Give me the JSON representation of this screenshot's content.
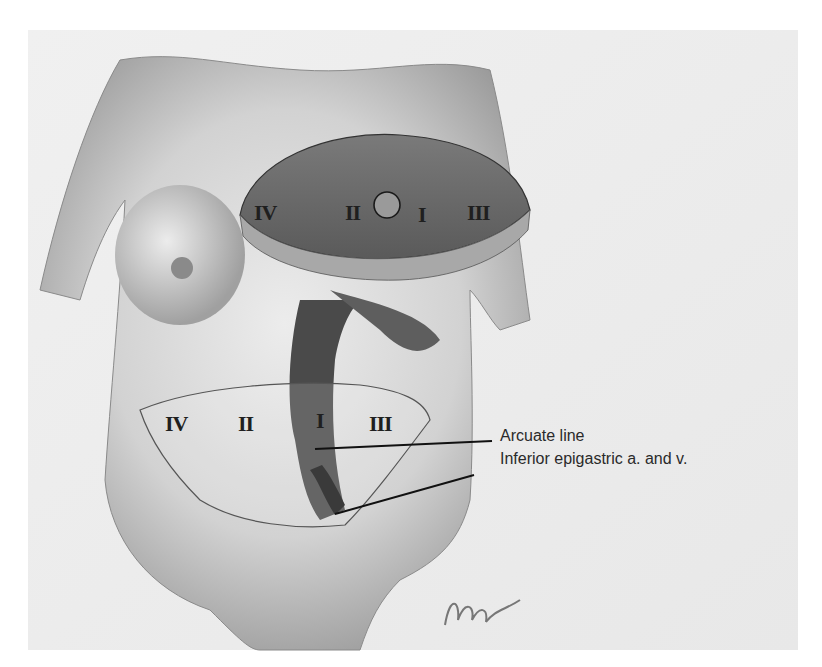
{
  "figure": {
    "upper_flap": {
      "zones": [
        {
          "label": "IV",
          "x": 254,
          "y": 202
        },
        {
          "label": "II",
          "x": 345,
          "y": 202
        },
        {
          "label": "I",
          "x": 418,
          "y": 204
        },
        {
          "label": "III",
          "x": 467,
          "y": 202
        }
      ],
      "umbilicus_marker": "circle"
    },
    "lower_flap": {
      "zones": [
        {
          "label": "IV",
          "x": 165,
          "y": 413
        },
        {
          "label": "II",
          "x": 238,
          "y": 413
        },
        {
          "label": "I",
          "x": 316,
          "y": 410
        },
        {
          "label": "III",
          "x": 369,
          "y": 413
        }
      ]
    },
    "callouts": [
      {
        "label": "Arcuate line",
        "x": 500,
        "y": 428
      },
      {
        "label": "Inferior epigastric a. and v.",
        "x": 500,
        "y": 451
      }
    ],
    "signature": "Wynn"
  },
  "colors": {
    "background": "#ffffff",
    "paper": "#f2f2f2",
    "skin_light": "#e6e6e6",
    "skin_mid": "#bdbdbd",
    "skin_dark": "#7a7a7a",
    "flap": "#6a6a6a",
    "flap_edge": "#a8a8a8",
    "ink": "#1f1f1f"
  }
}
